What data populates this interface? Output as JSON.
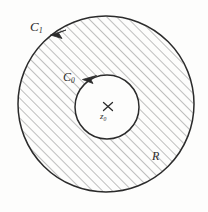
{
  "figure": {
    "kind": "complex-analysis-annulus-contour-diagram",
    "background_color": "#fdfdfc",
    "ink_color": "#2b2b2b",
    "width": 208,
    "height": 212,
    "labels": {
      "outer_contour": "C",
      "outer_contour_subscript": "1",
      "inner_contour": "C",
      "inner_contour_subscript": "0",
      "center_point": "z",
      "center_point_subscript": "0",
      "region": "R",
      "center_marker": "×"
    },
    "outer_circle": {
      "name": "C1",
      "cx": 106,
      "cy": 104,
      "r": 88,
      "orientation": "counterclockwise",
      "stroke_color": "#2b2b2b",
      "stroke_width": 1.4
    },
    "inner_circle": {
      "name": "C0",
      "cx": 107,
      "cy": 107,
      "r": 32,
      "orientation": "counterclockwise",
      "stroke_color": "#2b2b2b",
      "stroke_width": 1.4
    },
    "hatching": {
      "region": "R",
      "angle_degrees": 45,
      "spacing_px": 7,
      "stroke_color": "#4a4a4a",
      "stroke_width": 0.7
    },
    "arrowheads": [
      {
        "name": "c1-arrowhead",
        "on": "C1",
        "angle_degrees": 133,
        "direction": "counterclockwise"
      },
      {
        "name": "c0-arrowhead",
        "on": "C0",
        "angle_degrees": 123,
        "direction": "counterclockwise"
      }
    ]
  }
}
